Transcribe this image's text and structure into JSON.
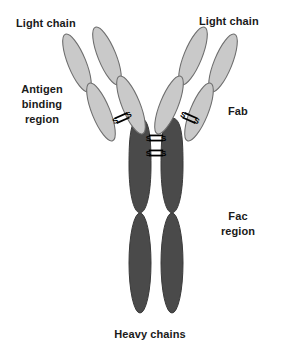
{
  "figure": {
    "width": 300,
    "height": 353,
    "background_color": "#ffffff"
  },
  "labels": {
    "light_chain_left": "Light chain",
    "light_chain_right": "Light chain",
    "antigen_binding_region": "Antigen\nbinding\nregion",
    "fab": "Fab",
    "fc_region": "Fac\nregion",
    "heavy_chains": "Heavy chains"
  },
  "colors": {
    "light_chain_fill": "#c9c9c9",
    "light_chain_stroke": "#6e6e6e",
    "heavy_chain_fill": "#4a4a4a",
    "heavy_chain_stroke": "#3a3a3a",
    "disulfide": "#000000",
    "text": "#1a1a1a",
    "background": "#ffffff"
  },
  "structure": {
    "light_chain_domains": [
      {
        "id": "left-outer-upper",
        "cx": 77,
        "cy": 63,
        "rx": 9,
        "ry": 31,
        "rotate": -22
      },
      {
        "id": "left-outer-lower",
        "cx": 101,
        "cy": 112,
        "rx": 9,
        "ry": 31,
        "rotate": -22
      },
      {
        "id": "left-inner-upper",
        "cx": 107,
        "cy": 56,
        "rx": 9,
        "ry": 31,
        "rotate": -22
      },
      {
        "id": "left-inner-lower",
        "cx": 131,
        "cy": 105,
        "rx": 9,
        "ry": 31,
        "rotate": -22
      },
      {
        "id": "right-outer-upper",
        "cx": 223,
        "cy": 63,
        "rx": 9,
        "ry": 31,
        "rotate": 22
      },
      {
        "id": "right-outer-lower",
        "cx": 199,
        "cy": 112,
        "rx": 9,
        "ry": 31,
        "rotate": 22
      },
      {
        "id": "right-inner-upper",
        "cx": 193,
        "cy": 56,
        "rx": 9,
        "ry": 31,
        "rotate": 22
      },
      {
        "id": "right-inner-lower",
        "cx": 169,
        "cy": 105,
        "rx": 9,
        "ry": 31,
        "rotate": 22
      }
    ],
    "heavy_chain_domains": [
      {
        "id": "left-ch2",
        "cx": 140,
        "cy": 165,
        "rx": 11,
        "ry": 48
      },
      {
        "id": "left-ch3",
        "cx": 140,
        "cy": 263,
        "rx": 11,
        "ry": 50
      },
      {
        "id": "right-ch2",
        "cx": 172,
        "cy": 165,
        "rx": 11,
        "ry": 48
      },
      {
        "id": "right-ch3",
        "cx": 172,
        "cy": 263,
        "rx": 11,
        "ry": 50
      }
    ],
    "disulfide_bonds": [
      {
        "id": "hinge-upper",
        "x": 156,
        "y": 137,
        "rotate": 0,
        "label": "S-S"
      },
      {
        "id": "hinge-lower",
        "x": 156,
        "y": 152,
        "rotate": 0,
        "label": "S-S"
      },
      {
        "id": "left-arm",
        "x": 122,
        "y": 118,
        "rotate": -24,
        "label": "S-S"
      },
      {
        "id": "right-arm",
        "x": 190,
        "y": 118,
        "rotate": 24,
        "label": "S-S"
      }
    ]
  }
}
